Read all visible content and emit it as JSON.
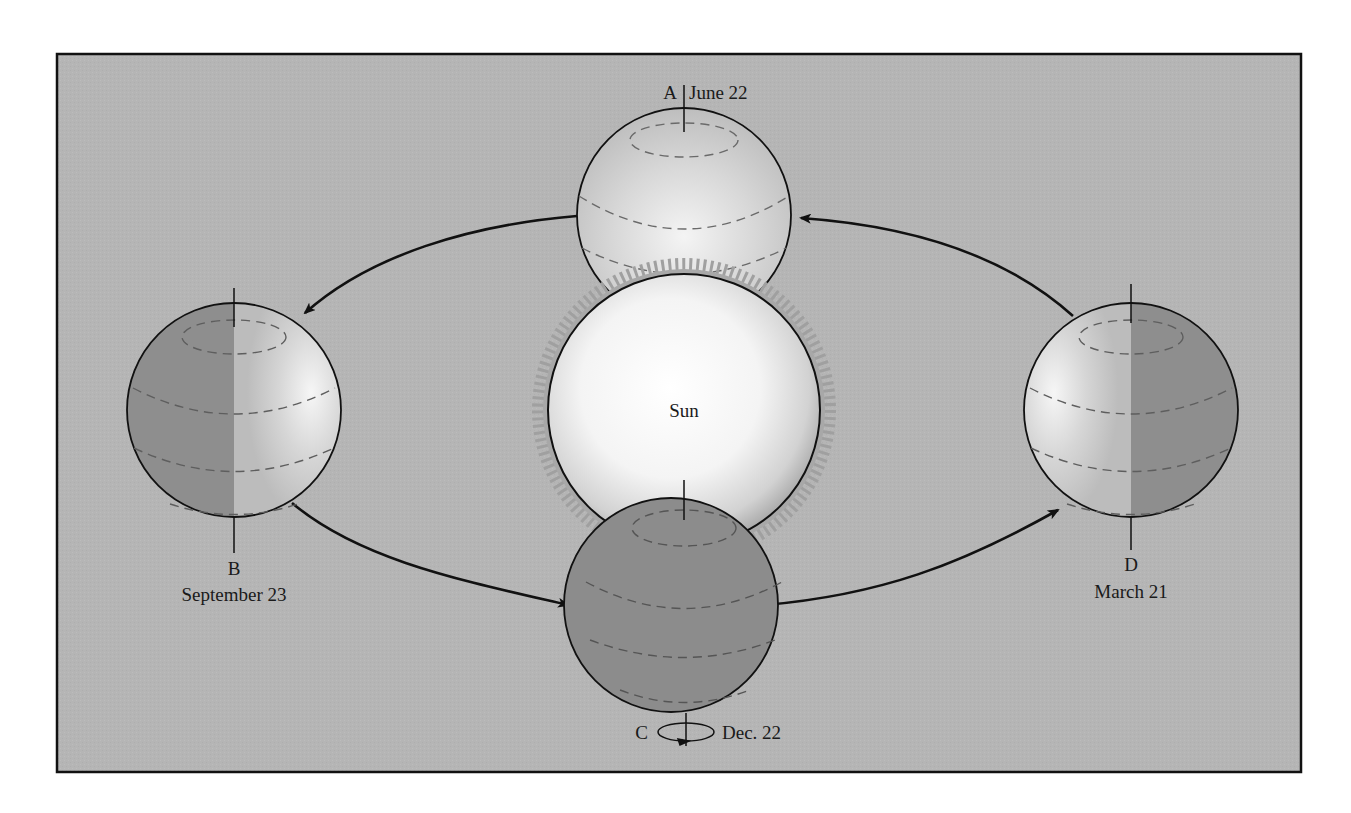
{
  "diagram": {
    "sun": {
      "label": "Sun"
    },
    "positions": [
      {
        "id": "A",
        "letter": "A",
        "date": "June 22",
        "lit": "full"
      },
      {
        "id": "B",
        "letter": "B",
        "date": "September 23",
        "lit": "right-half"
      },
      {
        "id": "C",
        "letter": "C",
        "date": "Dec. 22",
        "lit": "none"
      },
      {
        "id": "D",
        "letter": "D",
        "date": "March 21",
        "lit": "left-half"
      }
    ],
    "orbit_direction": "counterclockwise (A → B → C → D → A)",
    "colors": {
      "background": "#b5b5b5",
      "frame": "#111111",
      "globe_light": "#d8d8d8",
      "globe_dark": "#8c8c8c",
      "sun_core": "#ffffff",
      "corona": "#a3a3a3"
    }
  }
}
